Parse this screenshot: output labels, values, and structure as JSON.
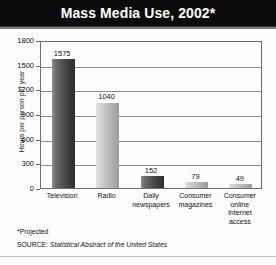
{
  "chart_data": {
    "type": "bar",
    "title": "Mass Media Use, 2002*",
    "xlabel": "",
    "ylabel": "Hours per person per year",
    "ylim": [
      0,
      1800
    ],
    "yticks": [
      0,
      300,
      600,
      900,
      1200,
      1500,
      1800
    ],
    "ytick_labels": [
      "0",
      "300",
      "600",
      "900",
      "1200",
      "1500",
      "1800"
    ],
    "grid": true,
    "legend": "none",
    "categories": [
      "Television",
      "Radio",
      "Daily\nnewspapers",
      "Consumer\nmagazines",
      "Consumer\nonline\nInternet\naccess"
    ],
    "values": [
      1575,
      1040,
      152,
      79,
      49
    ],
    "value_labels": [
      "1575",
      "1040",
      "152",
      "79",
      "49"
    ],
    "bar_shades": [
      "dark",
      "light",
      "dark",
      "light",
      "light"
    ],
    "annotations": {
      "footnote": "*Projected",
      "source_label": "SOURCE:",
      "source_name": "Statistical Abstract of the United States"
    },
    "colors": {
      "title_bar": "#0b0b0b",
      "title_text": "#ffffff",
      "bar_dark": "#4a4a4a",
      "bar_light": "#b6b6b6",
      "gridline": "#8a8a8a",
      "plot_border": "#6d6d6d",
      "background": "#fdfdfd"
    }
  }
}
